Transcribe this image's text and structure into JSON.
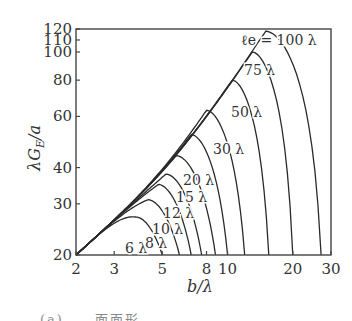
{
  "chart_data": {
    "type": "line",
    "title": "",
    "xlabel": "b/λ",
    "ylabel": "λG_E/a",
    "xscale": "log",
    "yscale": "log",
    "xlim": [
      2,
      30
    ],
    "ylim": [
      20,
      120
    ],
    "xticks": [
      2,
      3,
      5,
      8,
      10,
      20,
      30
    ],
    "yticks": [
      20,
      30,
      40,
      60,
      80,
      100,
      110,
      120
    ],
    "grid": false,
    "legend": "inline curve labels",
    "series": [
      {
        "name": "ℓe = 100 λ",
        "label": "ℓe = 100 λ",
        "peak": [
          15,
          118
        ],
        "end": 27
      },
      {
        "name": "75 λ",
        "label": "75 λ",
        "peak": [
          13,
          100
        ],
        "end": 20
      },
      {
        "name": "50 λ",
        "label": "50 λ",
        "peak": [
          10.5,
          80
        ],
        "end": 15.5
      },
      {
        "name": "30 λ",
        "label": "30 λ",
        "peak": [
          8,
          63
        ],
        "end": 12
      },
      {
        "name": "20 λ",
        "label": "20 λ",
        "peak": [
          6.8,
          52
        ],
        "end": 10
      },
      {
        "name": "15 λ",
        "label": "15 λ",
        "peak": [
          5.8,
          44
        ],
        "end": 8.8
      },
      {
        "name": "12 λ",
        "label": "12 λ",
        "peak": [
          5.2,
          38
        ],
        "end": 7.6
      },
      {
        "name": "10 λ",
        "label": "10 λ",
        "peak": [
          4.8,
          35
        ],
        "end": 6.8
      },
      {
        "name": "8 λ",
        "label": "8 λ",
        "peak": [
          4.3,
          31
        ],
        "end": 6
      },
      {
        "name": "6 λ",
        "label": "6 λ",
        "peak": [
          3.8,
          27
        ],
        "end": 5
      }
    ]
  },
  "axes": {
    "xlabel": "b/λ",
    "ylabel_main": "λG",
    "ylabel_sub": "E",
    "ylabel_tail": "/a"
  },
  "caption": "(a)  ... 面面形 ..."
}
